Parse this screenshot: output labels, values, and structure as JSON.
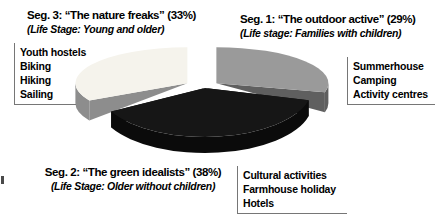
{
  "chart_data": {
    "type": "pie",
    "style": "3d-exploded",
    "title": "",
    "start_angle_deg": 90,
    "direction": "clockwise",
    "legend_position": "around-slices",
    "slices": [
      {
        "id": "seg1",
        "name": "The outdoor active",
        "pct": 29,
        "title": "Seg. 1: “The outdoor active” (29%)",
        "life_stage": "(Life stage: Families with children)",
        "activities": [
          "Summerhouse",
          "Camping",
          "Activity centres"
        ],
        "top_color": "#9a9a9a",
        "side_color": "#5f5f5f"
      },
      {
        "id": "seg2",
        "name": "The green idealists",
        "pct": 38,
        "title": "Seg. 2: “The green idealists” (38%)",
        "life_stage": "(Life Stage: Older without children)",
        "activities": [
          "Cultural activities",
          "Farmhouse holiday",
          "Hotels"
        ],
        "top_color": "#161616",
        "side_color": "#0b0b0b"
      },
      {
        "id": "seg3",
        "name": "The nature freaks",
        "pct": 33,
        "title": "Seg. 3: “The nature freaks” (33%)",
        "life_stage": "(Life Stage: Young and older)",
        "activities": [
          "Youth hostels",
          "Biking",
          "Hiking",
          "Sailing"
        ],
        "top_color": "#f5f3ec",
        "side_color": "#8d8d8d"
      }
    ]
  }
}
